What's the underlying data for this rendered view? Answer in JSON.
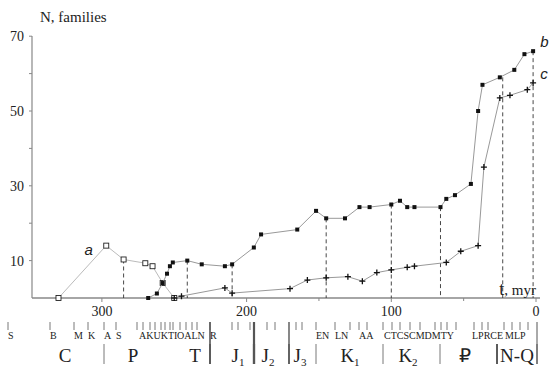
{
  "chart_data": {
    "type": "line",
    "ylabel": "N, families",
    "xlabel": "t, myr",
    "xlim": [
      330,
      0
    ],
    "ylim": [
      0,
      70
    ],
    "y_ticks": [
      10,
      30,
      50,
      70
    ],
    "y_minor_ticks": [
      20,
      40,
      60
    ],
    "x_ticks": [
      300,
      200,
      100,
      0
    ],
    "series": [
      {
        "name": "a",
        "marker": "open-square",
        "points": [
          [
            330,
            0
          ],
          [
            297,
            14
          ],
          [
            285,
            10.3
          ],
          [
            270,
            9.3
          ],
          [
            265,
            8.5
          ],
          [
            258,
            4
          ],
          [
            250,
            0
          ]
        ]
      },
      {
        "name": "b",
        "marker": "filled-square",
        "points": [
          [
            268,
            0
          ],
          [
            262,
            1.2
          ],
          [
            258,
            4
          ],
          [
            255,
            6.5
          ],
          [
            253,
            8.5
          ],
          [
            251,
            9.5
          ],
          [
            241,
            10
          ],
          [
            231,
            9
          ],
          [
            215,
            8.5
          ],
          [
            210,
            9
          ],
          [
            195,
            13.5
          ],
          [
            190,
            17
          ],
          [
            165,
            18.3
          ],
          [
            152,
            23.3
          ],
          [
            145,
            21.3
          ],
          [
            132,
            21.3
          ],
          [
            122,
            24.3
          ],
          [
            115,
            24.3
          ],
          [
            100,
            25
          ],
          [
            94,
            26
          ],
          [
            89,
            24.3
          ],
          [
            84,
            24.3
          ],
          [
            66,
            24.3
          ],
          [
            62,
            26.5
          ],
          [
            56,
            27.5
          ],
          [
            45,
            30.5
          ],
          [
            40,
            50
          ],
          [
            37,
            57
          ],
          [
            25,
            59
          ],
          [
            15,
            61
          ],
          [
            8,
            65.2
          ],
          [
            2,
            66
          ]
        ]
      },
      {
        "name": "c",
        "marker": "plus",
        "points": [
          [
            250,
            0
          ],
          [
            245,
            0.5
          ],
          [
            215,
            2.7
          ],
          [
            210,
            1.3
          ],
          [
            170,
            2.5
          ],
          [
            158,
            4.8
          ],
          [
            145,
            5.4
          ],
          [
            130,
            5.7
          ],
          [
            120,
            4.5
          ],
          [
            110,
            6.8
          ],
          [
            100,
            7.5
          ],
          [
            89,
            8.2
          ],
          [
            84,
            8.5
          ],
          [
            62,
            9.5
          ],
          [
            52,
            12.5
          ],
          [
            40,
            14
          ],
          [
            36,
            35
          ],
          [
            25,
            53.5
          ],
          [
            18,
            54.2
          ],
          [
            6,
            55.7
          ],
          [
            2,
            57.5
          ]
        ]
      }
    ],
    "dashed_verticals": [
      285,
      241,
      210,
      145,
      100,
      66,
      23,
      2
    ],
    "series_labels": [
      {
        "text": "a",
        "x": 312,
        "y": 11.5
      },
      {
        "text": "b",
        "x": -3,
        "y": 67
      },
      {
        "text": "c",
        "x": -3,
        "y": 58.5
      }
    ],
    "geologic_scale": {
      "stages": [
        "S",
        "B",
        "M",
        "K",
        "A",
        "S",
        "A",
        "K",
        "U",
        "K",
        "T",
        "I",
        "O",
        "A",
        "L",
        "N",
        "R",
        "E",
        "N",
        "L",
        "N",
        "A",
        "A",
        "C",
        "T",
        "C",
        "S",
        "C",
        "M",
        "D",
        "D",
        "M",
        "T",
        "Y",
        "L",
        "P",
        "R",
        "C",
        "E",
        "M",
        "L",
        "P"
      ],
      "periods": [
        {
          "label": "C",
          "from": 330,
          "to": 285
        },
        {
          "label": "P",
          "from": 285,
          "to": 241
        },
        {
          "label": "T",
          "from": 241,
          "to": 210
        },
        {
          "label": "J1",
          "from": 210,
          "to": 183
        },
        {
          "label": "J2",
          "from": 183,
          "to": 160
        },
        {
          "label": "J3",
          "from": 160,
          "to": 145
        },
        {
          "label": "K1",
          "from": 145,
          "to": 100
        },
        {
          "label": "K2",
          "from": 100,
          "to": 66
        },
        {
          "label": "₽",
          "from": 66,
          "to": 23
        },
        {
          "label": "N-Q",
          "from": 23,
          "to": 0
        }
      ]
    },
    "grid": false,
    "legend": "none"
  },
  "axis": {
    "y_title": "N, families",
    "x_title": "t, myr",
    "y_tick_labels": [
      "10",
      "30",
      "50",
      "70"
    ],
    "x_tick_labels": [
      "300",
      "200",
      "100",
      "0"
    ]
  },
  "stage_rows": [
    {
      "text": "S",
      "x": 8
    },
    {
      "text": "B",
      "x": 50
    },
    {
      "text": "M",
      "x": 74
    },
    {
      "text": "K",
      "x": 88
    },
    {
      "text": "A",
      "x": 104
    },
    {
      "text": "S",
      "x": 116
    },
    {
      "text": "AKUKTI",
      "x": 139
    },
    {
      "text": "OALN",
      "x": 177
    },
    {
      "text": "R",
      "x": 210
    },
    {
      "text": "EN",
      "x": 316
    },
    {
      "text": "LN",
      "x": 335
    },
    {
      "text": "AA",
      "x": 359
    },
    {
      "text": "CTCSCMDMTY",
      "x": 384
    },
    {
      "text": "LPRCE",
      "x": 472
    },
    {
      "text": "MLP",
      "x": 505
    }
  ],
  "period_labels": [
    {
      "text": "C",
      "sub": "",
      "x": 65
    },
    {
      "text": "P",
      "sub": "",
      "x": 133
    },
    {
      "text": "T",
      "sub": "",
      "x": 195
    },
    {
      "text": "J",
      "sub": "1",
      "x": 238
    },
    {
      "text": "J",
      "sub": "2",
      "x": 268
    },
    {
      "text": "J",
      "sub": "3",
      "x": 300
    },
    {
      "text": "K",
      "sub": "1",
      "x": 350
    },
    {
      "text": "K",
      "sub": "2",
      "x": 408
    },
    {
      "text": "₽",
      "sub": "",
      "x": 465
    },
    {
      "text": "N-Q",
      "sub": "",
      "x": 517
    }
  ]
}
